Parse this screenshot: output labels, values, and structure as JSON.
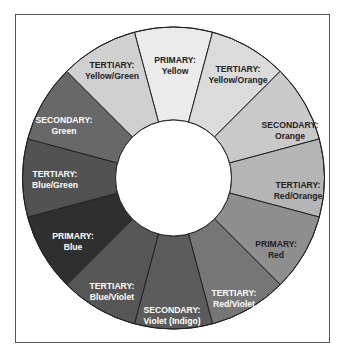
{
  "diagram": {
    "type": "color-wheel",
    "center": [
      173.5,
      178
    ],
    "outer_radius": 151,
    "inner_radius": 58,
    "start_angle_deg": -105,
    "segment_span_deg": 30,
    "segments": [
      {
        "category": "PRIMARY:",
        "name": "Yellow",
        "fill": "#ebebeb",
        "text": "#222222",
        "lx": 175,
        "ly": 56
      },
      {
        "category": "TERTIARY:",
        "name": "Yellow/Orange",
        "fill": "#dbdbdb",
        "text": "#222222",
        "lx": 238,
        "ly": 65
      },
      {
        "category": "SECONDARY:",
        "name": "Orange",
        "fill": "#c9c9c9",
        "text": "#222222",
        "lx": 290,
        "ly": 121
      },
      {
        "category": "TERTIARY:",
        "name": "Red/Orange",
        "fill": "#b5b5b5",
        "text": "#222222",
        "lx": 298,
        "ly": 181
      },
      {
        "category": "PRIMARY:",
        "name": "Red",
        "fill": "#8e8e8e",
        "text": "#222222",
        "lx": 276,
        "ly": 240
      },
      {
        "category": "TERTIARY:",
        "name": "Red/Violet",
        "fill": "#767676",
        "text": "#ffffff",
        "lx": 234,
        "ly": 289
      },
      {
        "category": "SECONDARY:",
        "name": "Violet (Indigo)",
        "fill": "#5c5c5c",
        "text": "#ffffff",
        "lx": 172,
        "ly": 306
      },
      {
        "category": "TERTIARY:",
        "name": "Blue/Violet",
        "fill": "#565656",
        "text": "#ffffff",
        "lx": 112,
        "ly": 282
      },
      {
        "category": "PRIMARY:",
        "name": "Blue",
        "fill": "#2f2f2f",
        "text": "#ffffff",
        "lx": 73,
        "ly": 232
      },
      {
        "category": "TERTIARY:",
        "name": "Blue/Green",
        "fill": "#525252",
        "text": "#ffffff",
        "lx": 55,
        "ly": 170
      },
      {
        "category": "SECONDARY:",
        "name": "Green",
        "fill": "#686868",
        "text": "#ffffff",
        "lx": 64,
        "ly": 116
      },
      {
        "category": "TERTIARY:",
        "name": "Yellow/Green",
        "fill": "#d0d0d0",
        "text": "#222222",
        "lx": 112,
        "ly": 61
      }
    ],
    "stroke_color": "#222222",
    "frame_color": "#555555"
  }
}
